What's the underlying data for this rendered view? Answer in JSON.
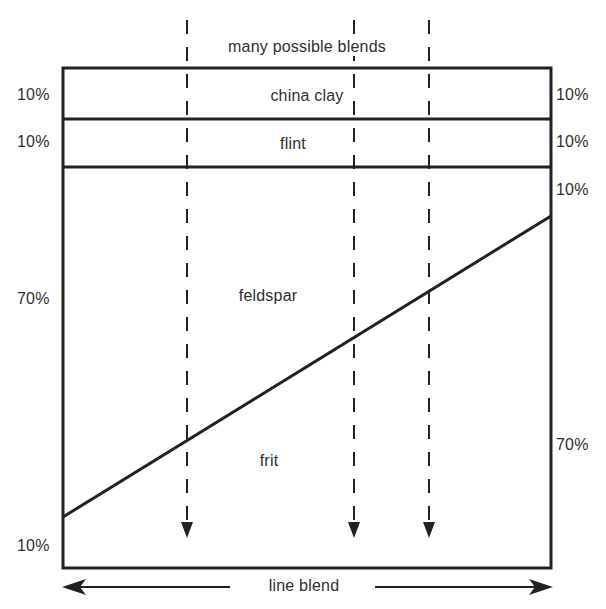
{
  "diagram": {
    "title": "many possible blends",
    "bottom_label": "line blend",
    "layers": [
      {
        "name": "china clay",
        "left_pct": "10%",
        "right_pct": "10%"
      },
      {
        "name": "flint",
        "left_pct": "10%",
        "right_pct": "10%"
      },
      {
        "name": "feldspar",
        "left_pct": "70%",
        "right_pct": "10%"
      },
      {
        "name": "frit",
        "left_pct": "10%",
        "right_pct": "70%"
      }
    ],
    "dashed_arrows_count": 3,
    "line_color": "#222222"
  }
}
